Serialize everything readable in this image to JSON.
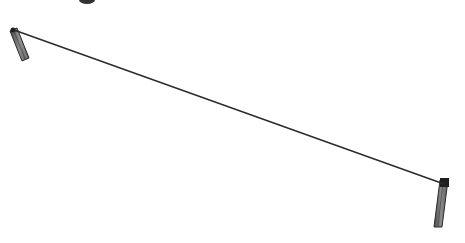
{
  "diagram": {
    "type": "line-drawing",
    "colors": {
      "background": "#ffffff",
      "wire": "#2a2a2a",
      "post_fill": "#7a7a7a",
      "post_outline": "#2b2b2b",
      "cap": "#1e1e1e"
    },
    "wire": {
      "x1": 14,
      "y1": 30,
      "x2": 444,
      "y2": 184,
      "stroke_width": 1.4
    },
    "posts": [
      {
        "name": "left-post",
        "points": "10,31 17,28 29,58 22,61",
        "cap": {
          "cx": 13,
          "cy": 30,
          "r": 2.5
        }
      },
      {
        "name": "right-post",
        "points": "440,180 448,180 442,227 434,227",
        "cap": {
          "x": 440,
          "y": 178,
          "w": 9,
          "h": 9
        }
      }
    ],
    "cropped_top_mark": {
      "cx": 87,
      "cy": 0,
      "rx": 8,
      "ry": 4
    }
  }
}
